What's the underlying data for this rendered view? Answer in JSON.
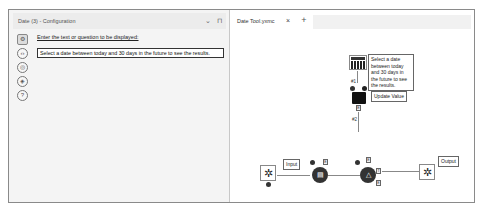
{
  "left_panel": {
    "title": "Date (3) - Configuration",
    "header_controls": {
      "dropdown": "⌄",
      "pin": "⊓"
    },
    "side_icons": [
      {
        "name": "gear-icon",
        "glyph": "⚙",
        "active": true
      },
      {
        "name": "code-icon",
        "glyph": "‹›",
        "active": false
      },
      {
        "name": "target-icon",
        "glyph": "◎",
        "active": false
      },
      {
        "name": "tag-icon",
        "glyph": "◈",
        "active": false
      },
      {
        "name": "help-icon",
        "glyph": "?",
        "active": false
      }
    ],
    "config": {
      "label": "Enter the text or question to be displayed:",
      "value": "Select a date between today and 30 days in the future to see the results."
    }
  },
  "right_panel": {
    "tab": {
      "label": "Date Tool.yxmc",
      "close": "×"
    },
    "add_tab": "+",
    "canvas": {
      "date_tool_comment": "Select a date between today and 30 days in the future to see the results.",
      "update_value_label": "Update Value",
      "input_label": "Input",
      "output_label": "Output",
      "connection_1": "#1",
      "connection_2": "#2",
      "anchor_q": "Q",
      "anchor_e": "E",
      "anchor_i": "I",
      "anchor_t": "T",
      "anchor_o": "O"
    }
  }
}
